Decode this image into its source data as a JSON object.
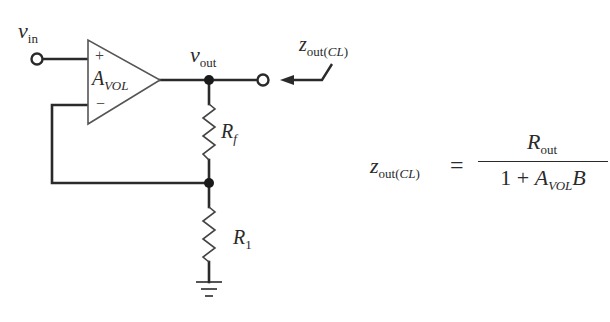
{
  "diagram": {
    "title": "",
    "type": "op-amp non-inverting amplifier with negative feedback (closed-loop output impedance)",
    "colors": {
      "line": "#2a2a2a",
      "background": "#ffffff",
      "amp_outline": "#555555"
    },
    "nodes": [
      {
        "id": "vin_terminal",
        "kind": "open-terminal",
        "label": "v_in"
      },
      {
        "id": "vout_node",
        "kind": "junction",
        "label": "v_out"
      },
      {
        "id": "out_terminal",
        "kind": "open-terminal"
      },
      {
        "id": "feedback_node",
        "kind": "junction"
      },
      {
        "id": "ground",
        "kind": "ground"
      }
    ],
    "components": [
      {
        "id": "opamp",
        "kind": "op-amp",
        "gain_label": "A_VOL",
        "inputs": [
          "+",
          "−"
        ]
      },
      {
        "id": "Rf",
        "kind": "resistor",
        "label": "R_f",
        "between": [
          "vout_node",
          "feedback_node"
        ]
      },
      {
        "id": "R1",
        "kind": "resistor",
        "label": "R_1",
        "between": [
          "feedback_node",
          "ground"
        ]
      }
    ],
    "edges": [
      [
        "vin_terminal",
        "opamp.+"
      ],
      [
        "opamp.out",
        "vout_node"
      ],
      [
        "vout_node",
        "out_terminal"
      ],
      [
        "feedback_node",
        "opamp.−"
      ]
    ],
    "annotations": [
      {
        "id": "zout_arrow",
        "label": "z_out(CL)",
        "points_to": "out_terminal"
      }
    ]
  },
  "labels": {
    "vin": {
      "main": "v",
      "sub": "in"
    },
    "vout": {
      "main": "v",
      "sub": "out"
    },
    "plus": "+",
    "minus": "−",
    "avol": {
      "main": "A",
      "sub": "VOL"
    },
    "rf": {
      "main": "R",
      "sub": "f"
    },
    "r1": {
      "main": "R",
      "sub": "1"
    },
    "zout_cl": {
      "main": "z",
      "sub": "out(",
      "sub_it": "CL",
      "sub_end": ")"
    }
  },
  "formula": {
    "lhs": {
      "main": "z",
      "sub": "out(",
      "sub_it": "CL",
      "sub_end": ")"
    },
    "equals": "=",
    "numerator": {
      "main": "R",
      "sub": "out"
    },
    "denominator": {
      "prefix": "1 + ",
      "main": "A",
      "sub": "VOL",
      "suffix": "B"
    }
  }
}
